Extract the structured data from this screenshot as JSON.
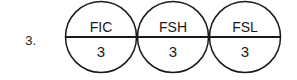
{
  "figure": {
    "item_number": "3.",
    "background_color": "#ffffff",
    "line_color": "#1a1a1a",
    "text_color": "#1a1a1a"
  },
  "bubbles": [
    {
      "tag": "FIC",
      "loop_number": "3",
      "cx": 101,
      "cy": 37,
      "r": 35.5
    },
    {
      "tag": "FSH",
      "loop_number": "3",
      "cx": 173,
      "cy": 37,
      "r": 35.5
    },
    {
      "tag": "FSL",
      "loop_number": "3",
      "cx": 245,
      "cy": 37,
      "r": 35.5
    }
  ],
  "divider_line": {
    "x1": 65,
    "x2": 281,
    "y": 37
  }
}
